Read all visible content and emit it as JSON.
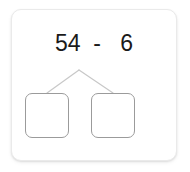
{
  "worksheet": {
    "problem": {
      "expression": "54  -   6",
      "minuend": 54,
      "operator": "-",
      "subtrahend": 6
    },
    "number_bond": {
      "apex_label": "",
      "branches": 2,
      "boxes": [
        {
          "name": "left-answer-box",
          "value": ""
        },
        {
          "name": "right-answer-box",
          "value": ""
        }
      ]
    },
    "colors": {
      "card_background": "#ffffff",
      "card_border": "#eaeaea",
      "text": "#1a1a1a",
      "box_border": "#9b9b9b",
      "connector_line": "#c8c8c8"
    }
  }
}
